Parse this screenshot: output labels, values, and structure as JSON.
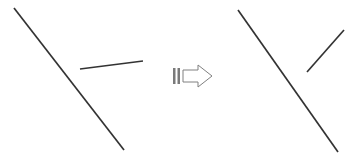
{
  "canvas": {
    "width": 363,
    "height": 158,
    "background_color": "#ffffff",
    "alt_text": "Geometric diagram: a long diagonal line with a short segment, an arrow, then the same long line with the short segment rotated"
  },
  "style": {
    "line_color": "#333333",
    "line_width": 1.7,
    "arrow_stroke_color": "#808080",
    "arrow_fill_color": "#ffffff",
    "arrow_tail_fill_color": "#7a7a7a",
    "arrow_stroke_width": 1
  },
  "chart_data": {
    "type": "diagram",
    "title": "",
    "panels": [
      {
        "name": "before",
        "label": "",
        "segments": [
          {
            "name": "long-diagonal-line",
            "x1": 14,
            "y1": 8,
            "x2": 124,
            "y2": 150,
            "orientation": "down-right",
            "length": 179.6,
            "angle_deg": 52.2
          },
          {
            "name": "short-line",
            "x1": 80,
            "y1": 69,
            "x2": 143,
            "y2": 61,
            "orientation": "near-horizontal",
            "length": 63.5,
            "angle_deg": -7.2
          }
        ]
      },
      {
        "name": "after",
        "label": "",
        "segments": [
          {
            "name": "long-diagonal-line",
            "x1": 238,
            "y1": 10,
            "x2": 338,
            "y2": 152,
            "orientation": "down-right",
            "length": 173.7,
            "angle_deg": 54.8
          },
          {
            "name": "short-line",
            "x1": 307,
            "y1": 72,
            "x2": 344,
            "y2": 30,
            "orientation": "up-right",
            "length": 55.9,
            "angle_deg": -48.6
          }
        ]
      }
    ],
    "connector": {
      "name": "transformation-arrow",
      "type": "block-arrow",
      "direction": "right",
      "x": 172,
      "y": 64,
      "width": 40,
      "height": 24,
      "outline_points": "183,70 198,70 198,65 212,76 198,87 198,82 183,82",
      "tail_bars": [
        {
          "x": 173,
          "y": 68,
          "width": 2.5,
          "height": 16
        },
        {
          "x": 177.5,
          "y": 68,
          "width": 2.5,
          "height": 16
        }
      ]
    }
  }
}
